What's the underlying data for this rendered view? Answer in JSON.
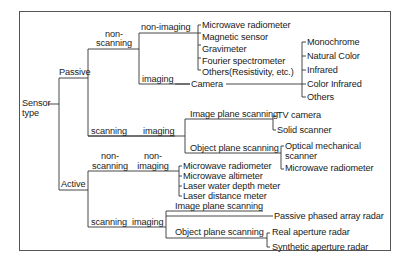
{
  "root": {
    "label_line1": "Sensor",
    "label_line2": "type"
  },
  "passive": {
    "label": "Passive",
    "non_scanning": {
      "label_line1": "non-",
      "label_line2": "scanning",
      "non_imaging": {
        "label": "non-imaging",
        "items": [
          "Microwave radiometer",
          "Magnetic sensor",
          "Gravimeter",
          "Fourier spectrometer",
          "Others(Resistivity, etc.)"
        ]
      },
      "imaging": {
        "label": "imaging",
        "camera": "Camera",
        "camera_types": [
          "Monochrome",
          "Natural Color",
          "Infrared",
          "Color Infrared",
          "Others"
        ]
      }
    },
    "scanning": {
      "label": "scanning",
      "imaging": {
        "label": "imaging",
        "image_plane": {
          "label": "Image plane scanning",
          "items": [
            "TV camera",
            "Solid scanner"
          ]
        },
        "object_plane": {
          "label": "Object plane scanning",
          "items": [
            "Optical mechanical",
            "scanner",
            "Microwave radiometer"
          ]
        }
      }
    }
  },
  "active": {
    "label": "Active",
    "non_scanning": {
      "label_line1": "non-",
      "label_line2": "scanning",
      "non_imaging": {
        "label_line1": "non-",
        "label_line2": "imaging",
        "items": [
          "Microwave radiometer",
          "Microwave altimeter",
          "Laser water depth meter",
          "Laser distance meter"
        ]
      }
    },
    "scanning": {
      "label": "scanning",
      "imaging": {
        "label": "imaging",
        "image_plane": {
          "label": "Image plane scanning",
          "items": [
            "Passive phased array radar"
          ]
        },
        "object_plane": {
          "label": "Object plane scanning",
          "items": [
            "Real aperture radar",
            "Synthetic aperture radar"
          ]
        }
      }
    }
  }
}
